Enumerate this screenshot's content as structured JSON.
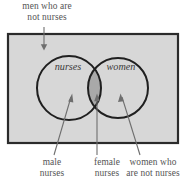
{
  "figure": {
    "type": "venn-diagram",
    "universe_label_line1": "men who are",
    "universe_label_line2": "not nurses",
    "sets": [
      {
        "id": "nurses",
        "label": "nurses"
      },
      {
        "id": "women",
        "label": "women"
      }
    ],
    "region_labels": [
      {
        "id": "male-nurses",
        "line1": "male",
        "line2": "nurses"
      },
      {
        "id": "female-nurses",
        "line1": "female",
        "line2": "nurses"
      },
      {
        "id": "women-not-nurses",
        "line1": "women who",
        "line2": "are not nurses"
      }
    ],
    "colors": {
      "page_background": "#ffffff",
      "universe_fill": "#d7d7d7",
      "universe_stroke": "#2b2b2b",
      "circle_stroke": "#1f1f1f",
      "intersection_fill": "#a9a9a9",
      "arrow_stroke": "#6e6e6e",
      "text": "#555555"
    }
  }
}
